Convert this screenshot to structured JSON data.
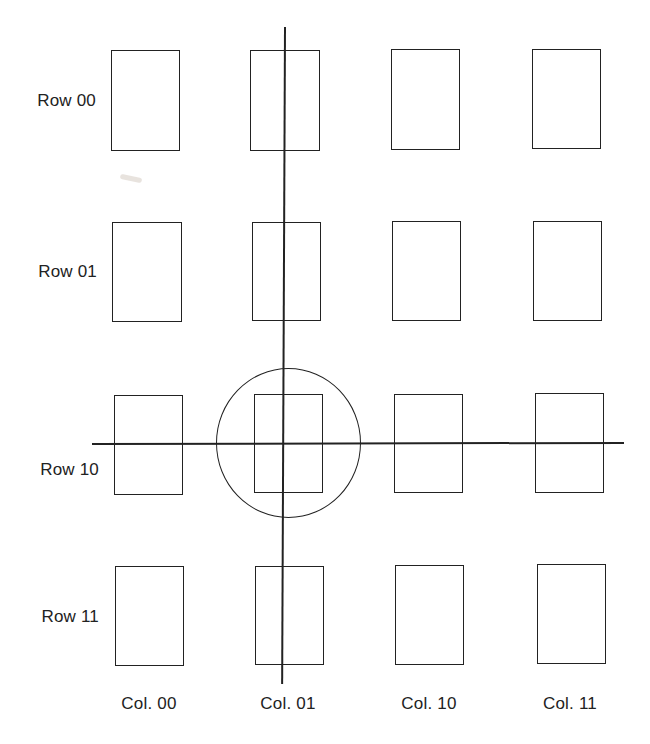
{
  "diagram": {
    "title": "",
    "row_labels": [
      "Row 00",
      "Row 01",
      "Row 10",
      "Row 11"
    ],
    "col_labels": [
      "Col. 00",
      "Col. 01",
      "Col. 10",
      "Col. 11"
    ],
    "selected": {
      "row": "Row 10",
      "col": "Col. 01",
      "marker": "circle",
      "select_lines": [
        "vertical line through Col. 01",
        "horizontal line through Row 10"
      ]
    },
    "cells": [
      {
        "row": "Row 00",
        "col": "Col. 00",
        "x": 111,
        "y": 50,
        "w": 69,
        "h": 101
      },
      {
        "row": "Row 00",
        "col": "Col. 01",
        "x": 250,
        "y": 50,
        "w": 70,
        "h": 101
      },
      {
        "row": "Row 00",
        "col": "Col. 10",
        "x": 391,
        "y": 49,
        "w": 69,
        "h": 101
      },
      {
        "row": "Row 00",
        "col": "Col. 11",
        "x": 532,
        "y": 49,
        "w": 69,
        "h": 100
      },
      {
        "row": "Row 01",
        "col": "Col. 00",
        "x": 112,
        "y": 222,
        "w": 70,
        "h": 100
      },
      {
        "row": "Row 01",
        "col": "Col. 01",
        "x": 252,
        "y": 222,
        "w": 69,
        "h": 99
      },
      {
        "row": "Row 01",
        "col": "Col. 10",
        "x": 392,
        "y": 221,
        "w": 69,
        "h": 100
      },
      {
        "row": "Row 01",
        "col": "Col. 11",
        "x": 533,
        "y": 221,
        "w": 69,
        "h": 100
      },
      {
        "row": "Row 10",
        "col": "Col. 00",
        "x": 114,
        "y": 395,
        "w": 69,
        "h": 100
      },
      {
        "row": "Row 10",
        "col": "Col. 01",
        "x": 254,
        "y": 394,
        "w": 69,
        "h": 99
      },
      {
        "row": "Row 10",
        "col": "Col. 10",
        "x": 394,
        "y": 394,
        "w": 69,
        "h": 99
      },
      {
        "row": "Row 10",
        "col": "Col. 11",
        "x": 535,
        "y": 393,
        "w": 69,
        "h": 100
      },
      {
        "row": "Row 11",
        "col": "Col. 00",
        "x": 115,
        "y": 566,
        "w": 69,
        "h": 100
      },
      {
        "row": "Row 11",
        "col": "Col. 01",
        "x": 255,
        "y": 566,
        "w": 69,
        "h": 99
      },
      {
        "row": "Row 11",
        "col": "Col. 10",
        "x": 395,
        "y": 565,
        "w": 69,
        "h": 100
      },
      {
        "row": "Row 11",
        "col": "Col. 11",
        "x": 537,
        "y": 564,
        "w": 69,
        "h": 100
      }
    ],
    "colors": {
      "background": "#ffffff",
      "stroke": "#222222",
      "text": "#222222"
    }
  }
}
